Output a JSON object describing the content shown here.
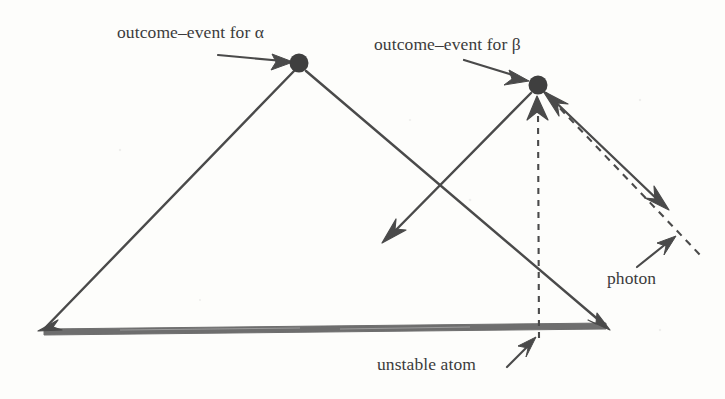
{
  "figure": {
    "kind": "spacetime-diagram",
    "background_color": "#fdfdfb",
    "ink_color": "#4a4a4a",
    "worldline_color": "#6b6b6b",
    "labels": {
      "outcome_event_alpha": "outcome–event for α",
      "outcome_event_beta": "outcome–event for β",
      "unstable_atom": "unstable atom",
      "photon": "photon"
    },
    "events": [
      {
        "name": "alpha-outcome-event",
        "symbol": "α",
        "x": 299,
        "y": 63,
        "r": 9.5
      },
      {
        "name": "beta-outcome-event",
        "symbol": "β",
        "x": 538,
        "y": 85,
        "r": 9.5
      }
    ],
    "elements": [
      {
        "name": "unstable-atom-worldline",
        "style": "thick-solid",
        "from": [
          42,
          333
        ],
        "to": [
          608,
          327
        ],
        "arrowheads": "both"
      },
      {
        "name": "alpha-left-light-ray",
        "style": "solid",
        "from": [
          42,
          331
        ],
        "to": [
          299,
          66
        ],
        "arrowheads": "start"
      },
      {
        "name": "alpha-right-light-ray",
        "style": "solid",
        "from": [
          306,
          70
        ],
        "to": [
          608,
          327
        ],
        "arrowheads": "end"
      },
      {
        "name": "alpha-scattered-ray",
        "style": "solid",
        "from": [
          530,
          92
        ],
        "to": [
          385,
          240
        ],
        "arrowheads": "end"
      },
      {
        "name": "beta-right-light-ray",
        "style": "solid",
        "from": [
          546,
          92
        ],
        "to": [
          668,
          208
        ],
        "arrowheads": "end"
      },
      {
        "name": "photon-dashed-worldline",
        "style": "dashed",
        "from": [
          546,
          94
        ],
        "to": [
          703,
          258
        ],
        "arrowheads": "start"
      },
      {
        "name": "atom-dashed-vertical",
        "style": "dashed",
        "from": [
          539,
          336
        ],
        "to": [
          538,
          100
        ],
        "arrowheads": "end"
      }
    ]
  }
}
